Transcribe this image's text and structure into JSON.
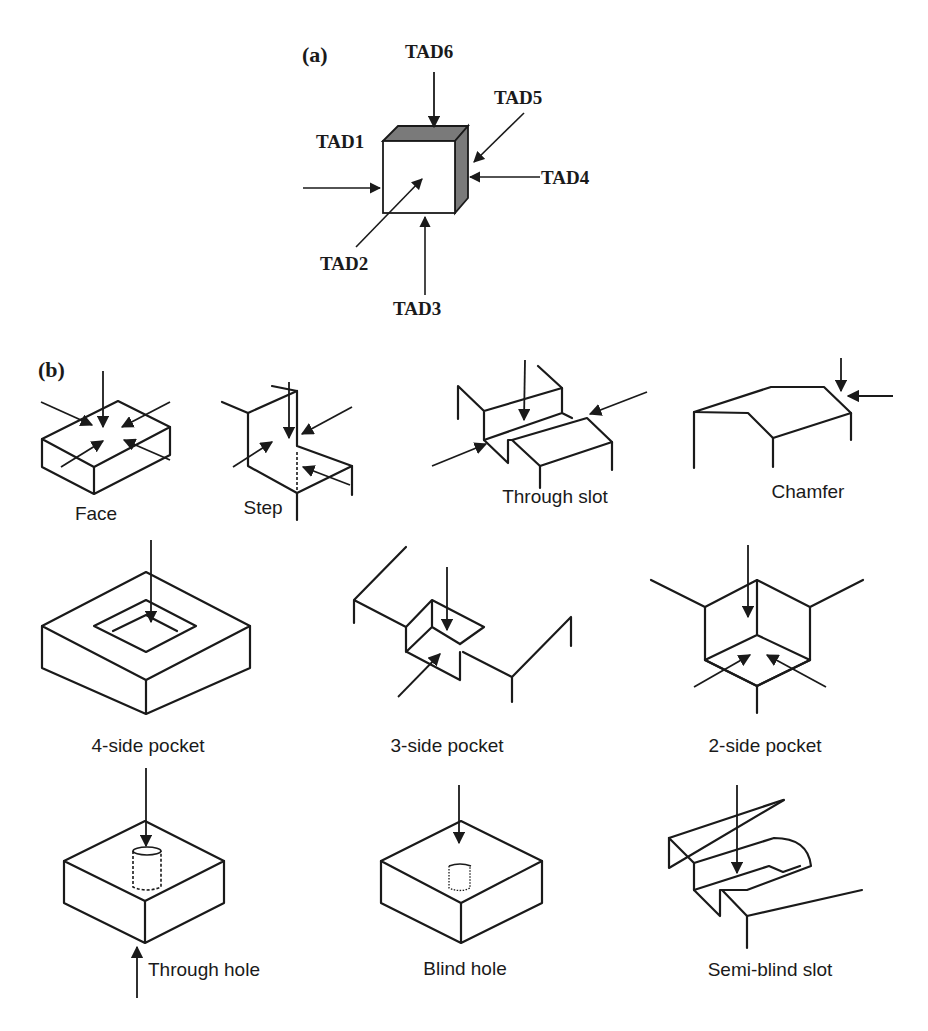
{
  "panel_a": {
    "label": "(a)",
    "tads": {
      "tad1": "TAD1",
      "tad2": "TAD2",
      "tad3": "TAD3",
      "tad4": "TAD4",
      "tad5": "TAD5",
      "tad6": "TAD6"
    },
    "colors": {
      "cube_front": "#ffffff",
      "cube_side": "#7a7a7a",
      "ink": "#1a1a1a"
    }
  },
  "panel_b": {
    "label": "(b)",
    "features": [
      {
        "id": "face",
        "label": "Face",
        "approach_arrows": 5
      },
      {
        "id": "step",
        "label": "Step",
        "approach_arrows": 3
      },
      {
        "id": "through-slot",
        "label": "Through slot",
        "approach_arrows": 3
      },
      {
        "id": "chamfer",
        "label": "Chamfer",
        "approach_arrows": 2
      },
      {
        "id": "four-side-pocket",
        "label": "4-side pocket",
        "approach_arrows": 1
      },
      {
        "id": "three-side-pocket",
        "label": "3-side pocket",
        "approach_arrows": 2
      },
      {
        "id": "two-side-pocket",
        "label": "2-side pocket",
        "approach_arrows": 3
      },
      {
        "id": "through-hole",
        "label": "Through hole",
        "approach_arrows": 2
      },
      {
        "id": "blind-hole",
        "label": "Blind hole",
        "approach_arrows": 1
      },
      {
        "id": "semi-blind-slot",
        "label": "Semi-blind slot",
        "approach_arrows": 1
      }
    ]
  }
}
